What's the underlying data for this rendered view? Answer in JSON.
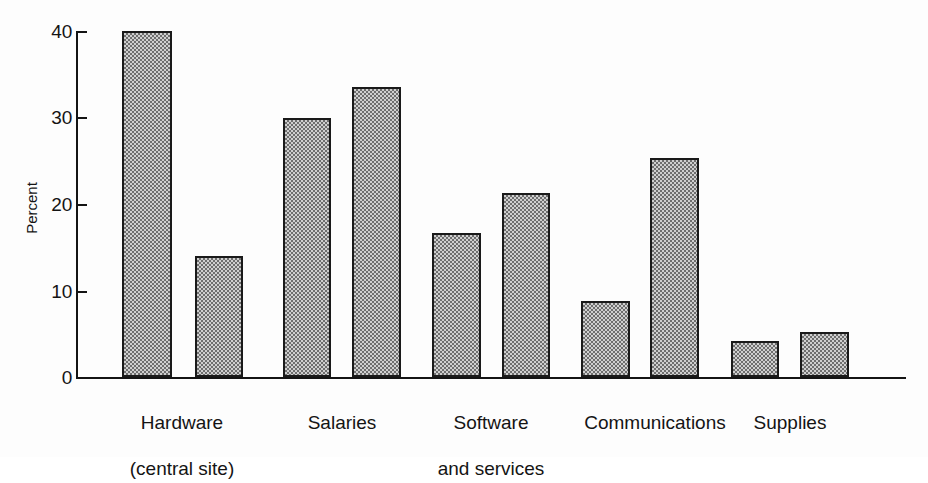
{
  "chart_data": {
    "type": "bar",
    "title": "",
    "subtitle": "",
    "xlabel": "",
    "ylabel": "Percent",
    "ylim": [
      0,
      40
    ],
    "yticks": [
      0,
      10,
      20,
      30,
      40
    ],
    "ytick_labels": [
      "0",
      "10",
      "20",
      "30",
      "40"
    ],
    "grid": false,
    "legend": null,
    "legend_position": "none",
    "categories": [
      "Hardware\n(central site)",
      "Salaries",
      "Software\nand services",
      "Communications",
      "Supplies"
    ],
    "category_lines": [
      [
        "Hardware",
        "(central site)"
      ],
      [
        "Salaries"
      ],
      [
        "Software",
        "and services"
      ],
      [
        "Communications"
      ],
      [
        "Supplies"
      ]
    ],
    "series": [
      {
        "name": "series-1",
        "values": [
          40.0,
          30.0,
          16.7,
          8.8,
          4.2
        ]
      },
      {
        "name": "series-2",
        "values": [
          14.0,
          33.5,
          21.3,
          25.3,
          5.2
        ]
      }
    ],
    "bar_fill": "#cfcfcf",
    "bar_edge": "#1a1a1a",
    "axis_color": "#141414",
    "background": "#fdfdfd"
  },
  "bars": [
    {
      "label": "hardware-central-site-series-1",
      "value": 40.0,
      "x": 122,
      "width": 50
    },
    {
      "label": "hardware-central-site-series-2",
      "value": 14.0,
      "x": 195,
      "width": 48
    },
    {
      "label": "salaries-series-1",
      "value": 30.0,
      "x": 283,
      "width": 48
    },
    {
      "label": "salaries-series-2",
      "value": 33.5,
      "x": 352,
      "width": 49
    },
    {
      "label": "software-and-services-series-1",
      "value": 16.7,
      "x": 432,
      "width": 49
    },
    {
      "label": "software-and-services-series-2",
      "value": 21.3,
      "x": 502,
      "width": 48
    },
    {
      "label": "communications-series-1",
      "value": 8.8,
      "x": 581,
      "width": 49
    },
    {
      "label": "communications-series-2",
      "value": 25.3,
      "x": 650,
      "width": 49
    },
    {
      "label": "supplies-series-1",
      "value": 4.2,
      "x": 731,
      "width": 48
    },
    {
      "label": "supplies-series-2",
      "value": 5.2,
      "x": 800,
      "width": 49
    }
  ],
  "axis": {
    "y_title": "Percent",
    "tick_0": "0",
    "tick_10": "10",
    "tick_20": "20",
    "tick_30": "30",
    "tick_40": "40"
  },
  "categories_text": {
    "c0_line1": "Hardware",
    "c0_line2": "(central site)",
    "c1_line1": "Salaries",
    "c1_line2": "",
    "c2_line1": "Software",
    "c2_line2": "and services",
    "c3_line1": "Communications",
    "c3_line2": "",
    "c4_line1": "Supplies",
    "c4_line2": ""
  }
}
